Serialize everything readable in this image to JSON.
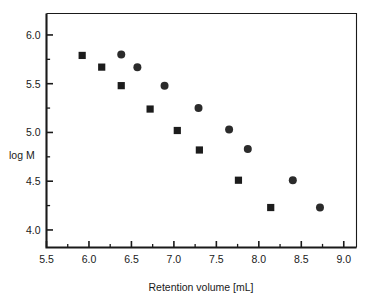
{
  "chart_data": {
    "type": "scatter",
    "title": "",
    "xlabel": "Retention volume [mL]",
    "ylabel": "log M",
    "xlim": [
      5.5,
      9.15
    ],
    "ylim": [
      3.82,
      6.22
    ],
    "grid": false,
    "legend_position": "none",
    "xticks": [
      5.5,
      6.0,
      6.5,
      7.0,
      7.5,
      8.0,
      8.5,
      9.0
    ],
    "xtick_labels": [
      "5.5",
      "6.0",
      "6.5",
      "7.0",
      "7.5",
      "8.0",
      "8.5",
      "9.0"
    ],
    "xtick_minor": [
      5.75,
      6.25,
      6.75,
      7.25,
      7.75,
      8.25,
      8.75
    ],
    "yticks": [
      4.0,
      4.5,
      5.0,
      5.5,
      6.0
    ],
    "ytick_labels": [
      "4.0",
      "4.5",
      "5.0",
      "5.5",
      "6.0"
    ],
    "ytick_minor": [
      4.25,
      4.75,
      5.25,
      5.75
    ],
    "series": [
      {
        "name": "series-square",
        "marker": "square",
        "color": "#1c1c1c",
        "points": [
          {
            "x": 5.92,
            "y": 5.79
          },
          {
            "x": 6.15,
            "y": 5.67
          },
          {
            "x": 6.38,
            "y": 5.48
          },
          {
            "x": 6.72,
            "y": 5.24
          },
          {
            "x": 7.04,
            "y": 5.02
          },
          {
            "x": 7.3,
            "y": 4.82
          },
          {
            "x": 7.76,
            "y": 4.51
          },
          {
            "x": 8.14,
            "y": 4.23
          }
        ]
      },
      {
        "name": "series-circle",
        "marker": "circle",
        "color": "#2b2b2b",
        "points": [
          {
            "x": 6.38,
            "y": 5.8
          },
          {
            "x": 6.57,
            "y": 5.67
          },
          {
            "x": 6.89,
            "y": 5.48
          },
          {
            "x": 7.29,
            "y": 5.25
          },
          {
            "x": 7.65,
            "y": 5.03
          },
          {
            "x": 7.87,
            "y": 4.83
          },
          {
            "x": 8.4,
            "y": 4.51
          },
          {
            "x": 8.72,
            "y": 4.23
          }
        ]
      }
    ]
  }
}
